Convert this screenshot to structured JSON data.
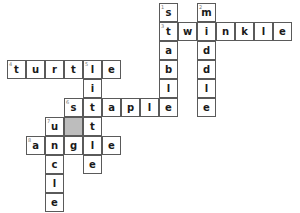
{
  "puzzle": {
    "type": "crossword",
    "cell_size": 19,
    "origin": {
      "x": 7,
      "y": 3
    },
    "shade_color": "#bdbdbd",
    "line_color": "#5a5a5a",
    "words": [
      {
        "number": 1,
        "direction": "down",
        "answer": "stable",
        "row": 0,
        "col": 8
      },
      {
        "number": 2,
        "direction": "down",
        "answer": "middle",
        "row": 0,
        "col": 10
      },
      {
        "number": 3,
        "direction": "across",
        "answer": "twinkle",
        "row": 1,
        "col": 8
      },
      {
        "number": 4,
        "direction": "across",
        "answer": "turtle",
        "row": 3,
        "col": 0
      },
      {
        "number": 5,
        "direction": "down",
        "answer": "little",
        "row": 3,
        "col": 4
      },
      {
        "number": 6,
        "direction": "across",
        "answer": "staple",
        "row": 5,
        "col": 3
      },
      {
        "number": 7,
        "direction": "down",
        "answer": "uncle",
        "row": 6,
        "col": 2
      },
      {
        "number": 8,
        "direction": "across",
        "answer": "angle",
        "row": 7,
        "col": 1
      }
    ],
    "shaded_cells": [
      {
        "row": 6,
        "col": 3
      }
    ]
  }
}
